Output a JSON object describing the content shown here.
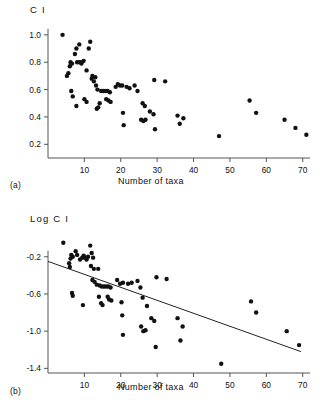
{
  "figure": {
    "panels": [
      {
        "key": "a",
        "label": "(a)",
        "y_axis_title": "C I",
        "x_axis_label": "Number of taxa"
      },
      {
        "key": "b",
        "label": "(b)",
        "y_axis_title": "Log  C I",
        "x_axis_label": "Number of taxa"
      }
    ]
  },
  "chart_data": [
    {
      "type": "scatter",
      "panel": "a",
      "title": "",
      "xlabel": "Number of taxa",
      "ylabel": "C I",
      "xlim": [
        0,
        72
      ],
      "ylim": [
        0.1,
        1.05
      ],
      "xticks": [
        10,
        20,
        30,
        40,
        50,
        60,
        70
      ],
      "xticklabels": [
        "10",
        "20",
        "30",
        "40",
        "50",
        "60",
        "70"
      ],
      "yticks": [
        0.2,
        0.4,
        0.6,
        0.8,
        1.0
      ],
      "yticklabels": [
        "0.2",
        "0.4",
        "0.6",
        "0.8",
        "1.0"
      ],
      "grid": false,
      "legend": "none",
      "marker": "filled-circle",
      "points": [
        [
          4.0,
          1.0
        ],
        [
          6.2,
          0.8
        ],
        [
          6.6,
          0.79
        ],
        [
          6.0,
          0.77
        ],
        [
          5.6,
          0.72
        ],
        [
          5.2,
          0.7
        ],
        [
          7.4,
          0.86
        ],
        [
          7.8,
          0.9
        ],
        [
          8.6,
          0.93
        ],
        [
          8.0,
          0.8
        ],
        [
          8.6,
          0.8
        ],
        [
          9.2,
          0.8
        ],
        [
          9.8,
          0.81
        ],
        [
          9.2,
          0.79
        ],
        [
          10.6,
          0.74
        ],
        [
          11.6,
          0.95
        ],
        [
          11.2,
          0.9
        ],
        [
          6.4,
          0.59
        ],
        [
          6.8,
          0.55
        ],
        [
          7.8,
          0.48
        ],
        [
          10.0,
          0.53
        ],
        [
          10.6,
          0.51
        ],
        [
          12.0,
          0.68
        ],
        [
          12.6,
          0.66
        ],
        [
          13.2,
          0.63
        ],
        [
          13.6,
          0.6
        ],
        [
          12.2,
          0.7
        ],
        [
          13.0,
          0.69
        ],
        [
          13.4,
          0.46
        ],
        [
          13.8,
          0.47
        ],
        [
          14.2,
          0.5
        ],
        [
          14.6,
          0.59
        ],
        [
          15.2,
          0.59
        ],
        [
          15.8,
          0.59
        ],
        [
          16.4,
          0.59
        ],
        [
          17.0,
          0.58
        ],
        [
          16.0,
          0.53
        ],
        [
          16.6,
          0.52
        ],
        [
          17.2,
          0.51
        ],
        [
          18.6,
          0.62
        ],
        [
          19.2,
          0.64
        ],
        [
          19.8,
          0.63
        ],
        [
          20.4,
          0.63
        ],
        [
          20.6,
          0.43
        ],
        [
          20.8,
          0.34
        ],
        [
          21.6,
          0.62
        ],
        [
          22.4,
          0.61
        ],
        [
          23.8,
          0.63
        ],
        [
          24.6,
          0.59
        ],
        [
          25.6,
          0.38
        ],
        [
          26.2,
          0.37
        ],
        [
          26.8,
          0.38
        ],
        [
          26.0,
          0.5
        ],
        [
          26.6,
          0.48
        ],
        [
          28.0,
          0.44
        ],
        [
          29.0,
          0.42
        ],
        [
          29.4,
          0.31
        ],
        [
          29.2,
          0.67
        ],
        [
          32.2,
          0.66
        ],
        [
          35.6,
          0.41
        ],
        [
          36.2,
          0.35
        ],
        [
          37.2,
          0.39
        ],
        [
          47.0,
          0.26
        ],
        [
          55.4,
          0.52
        ],
        [
          57.2,
          0.43
        ],
        [
          65.0,
          0.38
        ],
        [
          68.0,
          0.32
        ],
        [
          71.0,
          0.27
        ]
      ]
    },
    {
      "type": "scatter",
      "panel": "b",
      "title": "",
      "xlabel": "Number of taxa",
      "ylabel": "Log  C I",
      "xlim": [
        0,
        72
      ],
      "ylim": [
        -1.45,
        -0.02
      ],
      "xticks": [
        10,
        20,
        30,
        40,
        50,
        60,
        70
      ],
      "xticklabels": [
        "10",
        "20",
        "30",
        "40",
        "50",
        "60",
        "70"
      ],
      "yticks": [
        -0.2,
        -0.6,
        -1.0,
        -1.4
      ],
      "yticklabels": [
        "-0.2",
        "-0.6",
        "-1.0",
        "-1.4"
      ],
      "grid": false,
      "legend": "none",
      "marker": "filled-circle",
      "points": [
        [
          4.2,
          -0.05
        ],
        [
          6.4,
          -0.18
        ],
        [
          6.8,
          -0.2
        ],
        [
          6.2,
          -0.22
        ],
        [
          5.8,
          -0.27
        ],
        [
          6.0,
          -0.31
        ],
        [
          7.6,
          -0.14
        ],
        [
          8.0,
          -0.18
        ],
        [
          8.8,
          -0.23
        ],
        [
          9.4,
          -0.21
        ],
        [
          9.8,
          -0.19
        ],
        [
          10.2,
          -0.21
        ],
        [
          10.6,
          -0.23
        ],
        [
          11.0,
          -0.2
        ],
        [
          11.6,
          -0.08
        ],
        [
          12.0,
          -0.16
        ],
        [
          12.4,
          -0.21
        ],
        [
          6.6,
          -0.59
        ],
        [
          6.8,
          -0.62
        ],
        [
          9.6,
          -0.72
        ],
        [
          11.8,
          -0.3
        ],
        [
          12.6,
          -0.33
        ],
        [
          12.2,
          -0.45
        ],
        [
          12.8,
          -0.47
        ],
        [
          13.4,
          -0.5
        ],
        [
          13.8,
          -0.33
        ],
        [
          14.2,
          -0.51
        ],
        [
          14.0,
          -0.63
        ],
        [
          14.6,
          -0.7
        ],
        [
          15.0,
          -0.72
        ],
        [
          14.8,
          -0.52
        ],
        [
          15.4,
          -0.52
        ],
        [
          16.0,
          -0.52
        ],
        [
          16.6,
          -0.52
        ],
        [
          17.2,
          -0.53
        ],
        [
          16.4,
          -0.63
        ],
        [
          16.8,
          -0.66
        ],
        [
          17.4,
          -0.67
        ],
        [
          19.0,
          -0.45
        ],
        [
          19.8,
          -0.49
        ],
        [
          20.6,
          -0.48
        ],
        [
          20.2,
          -0.69
        ],
        [
          20.4,
          -0.83
        ],
        [
          20.6,
          -1.04
        ],
        [
          22.0,
          -0.49
        ],
        [
          23.0,
          -0.48
        ],
        [
          24.6,
          -0.46
        ],
        [
          25.4,
          -0.53
        ],
        [
          25.6,
          -0.95
        ],
        [
          26.2,
          -1.0
        ],
        [
          26.8,
          -0.99
        ],
        [
          26.0,
          -0.64
        ],
        [
          27.2,
          -0.73
        ],
        [
          28.4,
          -0.86
        ],
        [
          29.2,
          -0.89
        ],
        [
          29.6,
          -1.17
        ],
        [
          29.8,
          -0.42
        ],
        [
          32.6,
          -0.44
        ],
        [
          35.6,
          -0.86
        ],
        [
          36.4,
          -1.1
        ],
        [
          37.0,
          -0.95
        ],
        [
          47.6,
          -1.35
        ],
        [
          55.8,
          -0.68
        ],
        [
          57.2,
          -0.8
        ],
        [
          65.6,
          -1.0
        ],
        [
          69.0,
          -1.15
        ]
      ],
      "fit_line": {
        "x": [
          0.0,
          69.5
        ],
        "y": [
          -0.25,
          -1.22
        ],
        "style": "solid"
      }
    }
  ]
}
